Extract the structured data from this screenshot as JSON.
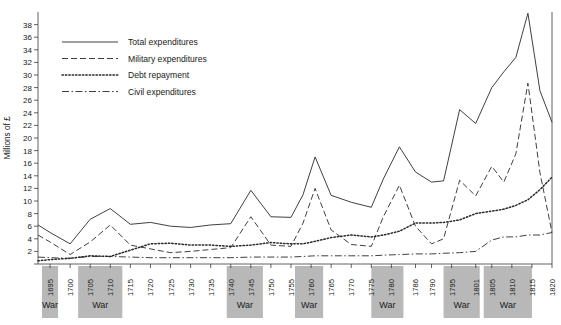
{
  "chart_data": {
    "type": "line",
    "title": "",
    "subtitle": "",
    "xlabel": "",
    "ylabel": "Millions of £",
    "xlim": [
      1692,
      1820
    ],
    "ylim": [
      0,
      40
    ],
    "yticks": [
      0,
      2,
      4,
      6,
      8,
      10,
      12,
      14,
      16,
      18,
      20,
      22,
      24,
      26,
      28,
      30,
      32,
      34,
      36,
      38
    ],
    "ytick_labels": [
      "",
      "2",
      "4",
      "6",
      "8",
      "10",
      "12",
      "14",
      "16",
      "18",
      "20",
      "22",
      "24",
      "26",
      "28",
      "30",
      "32",
      "34",
      "36",
      "38"
    ],
    "xticks": [
      1695,
      1700,
      1705,
      1710,
      1715,
      1720,
      1725,
      1730,
      1735,
      1740,
      1745,
      1750,
      1755,
      1760,
      1765,
      1770,
      1775,
      1780,
      1786,
      1790,
      1795,
      1801,
      1805,
      1810,
      1815,
      1820
    ],
    "xtick_labels": [
      "1695",
      "1700",
      "1705",
      "1710",
      "1715",
      "1720",
      "1725",
      "1730",
      "1735",
      "1740",
      "1745",
      "1750",
      "1755",
      "1760",
      "1765",
      "1770",
      "1775",
      "1780",
      "1786",
      "1790",
      "1795",
      "1801",
      "1805",
      "1810",
      "1815",
      "1820"
    ],
    "grid": false,
    "legend_position": "top-left",
    "x": [
      1692,
      1695,
      1700,
      1705,
      1710,
      1715,
      1720,
      1725,
      1730,
      1735,
      1740,
      1745,
      1750,
      1755,
      1758,
      1761,
      1765,
      1770,
      1775,
      1778,
      1782,
      1786,
      1790,
      1793,
      1797,
      1801,
      1805,
      1808,
      1811,
      1814,
      1817,
      1820
    ],
    "series": [
      {
        "name": "Total expenditures",
        "style": "solid",
        "values": [
          6.2,
          5.0,
          3.2,
          7.1,
          8.8,
          6.3,
          6.6,
          6.0,
          5.8,
          6.2,
          6.4,
          11.7,
          7.5,
          7.4,
          11.0,
          17.0,
          10.9,
          9.8,
          9.0,
          13.5,
          18.6,
          14.6,
          13.0,
          13.2,
          24.5,
          22.3,
          28.0,
          30.5,
          32.8,
          39.8,
          27.5,
          22.5
        ]
      },
      {
        "name": "Military expenditures",
        "style": "dashed",
        "values": [
          4.6,
          3.5,
          1.5,
          3.5,
          6.2,
          3.0,
          2.4,
          1.8,
          2.0,
          2.3,
          2.6,
          7.5,
          3.0,
          2.8,
          6.5,
          12.0,
          5.4,
          3.1,
          2.8,
          7.5,
          12.5,
          6.0,
          3.2,
          4.0,
          13.3,
          10.8,
          15.5,
          13.0,
          17.5,
          28.7,
          14.5,
          5.0
        ]
      },
      {
        "name": "Debt repayment",
        "style": "dotted",
        "values": [
          0.5,
          0.7,
          0.9,
          1.3,
          1.2,
          2.2,
          3.2,
          3.3,
          3.0,
          3.0,
          2.8,
          3.0,
          3.4,
          3.2,
          3.2,
          3.6,
          4.2,
          4.6,
          4.3,
          4.6,
          5.2,
          6.5,
          6.5,
          6.6,
          7.0,
          8.0,
          8.4,
          8.7,
          9.3,
          10.2,
          11.8,
          13.8
        ]
      },
      {
        "name": "Civil expenditures",
        "style": "dashdot",
        "values": [
          1.1,
          1.0,
          0.9,
          1.2,
          1.2,
          1.1,
          1.0,
          1.0,
          1.0,
          1.0,
          1.0,
          1.1,
          1.1,
          1.1,
          1.2,
          1.3,
          1.3,
          1.3,
          1.3,
          1.4,
          1.5,
          1.6,
          1.6,
          1.7,
          1.8,
          2.0,
          3.8,
          4.3,
          4.3,
          4.6,
          4.6,
          5.0
        ]
      }
    ],
    "war_periods": [
      {
        "label": "War",
        "start": 1693,
        "end": 1697
      },
      {
        "label": "War",
        "start": 1702,
        "end": 1713
      },
      {
        "label": "War",
        "start": 1739,
        "end": 1748
      },
      {
        "label": "War",
        "start": 1756,
        "end": 1763
      },
      {
        "label": "War",
        "start": 1775,
        "end": 1783
      },
      {
        "label": "War",
        "start": 1793,
        "end": 1802
      },
      {
        "label": "War",
        "start": 1803,
        "end": 1815
      }
    ],
    "colors": {
      "line": "#2a2a2a",
      "axis": "#3a3a3a",
      "war_band": "#b8b8b8",
      "background": "#ffffff"
    }
  },
  "legend": {
    "items": [
      {
        "label": "Total expenditures"
      },
      {
        "label": "Military expenditures"
      },
      {
        "label": "Debt repayment"
      },
      {
        "label": "Civil expenditures"
      }
    ]
  }
}
